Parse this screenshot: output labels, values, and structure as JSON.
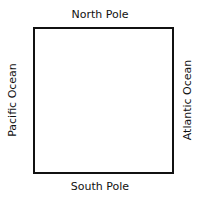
{
  "diagram": {
    "labels": {
      "top": "North Pole",
      "bottom": "South Pole",
      "left": "Pacific Ocean",
      "right": "Atlantic Ocean"
    }
  }
}
